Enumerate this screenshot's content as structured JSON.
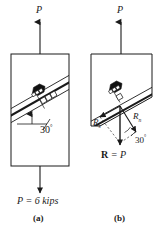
{
  "figure": {
    "title_alt": "Axially loaded member with inclined glued joint",
    "background_color": "#ffffff",
    "line_color": "#1a1a1a"
  },
  "panel_a": {
    "caption": "(a)",
    "top_load_label": "P",
    "bottom_load_label": "P = 6 kips",
    "angle_label": "30",
    "angle_degree_symbol": "°",
    "angle_value_deg": 30,
    "joint_description": "inclined glued joint with bolt",
    "member_description": "prismatic bar in tension"
  },
  "panel_b": {
    "caption": "(b)",
    "top_load_label": "P",
    "angle_label": "30",
    "angle_degree_symbol": "°",
    "angle_value_deg": 30,
    "resultant_label": "R = P",
    "resultant_bold_part": "R",
    "resultant_rest": " = P",
    "shear_label_base": "R",
    "shear_label_sub": "s",
    "normal_label_base": "R",
    "normal_label_sub": "n",
    "free_body_description": "upper segment free-body diagram with normal and shear components"
  }
}
